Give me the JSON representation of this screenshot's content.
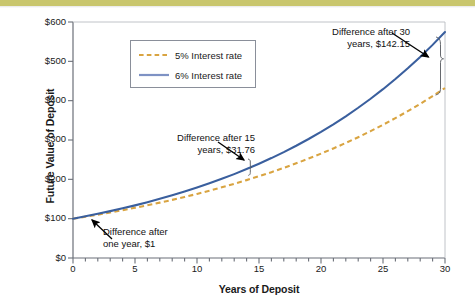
{
  "figure": {
    "background_color": "#ffffff",
    "top_band_color": "#c9c66d"
  },
  "chart_data": {
    "type": "line",
    "title": "",
    "xlabel": "Years of Deposit",
    "ylabel": "Future Value of Deposit",
    "xlim": [
      0,
      30
    ],
    "ylim": [
      0,
      600
    ],
    "grid": false,
    "legend_position": "upper-left-inside",
    "x_ticks": [
      0,
      5,
      10,
      15,
      20,
      25,
      30
    ],
    "x_tick_labels": [
      "0",
      "5",
      "10",
      "15",
      "20",
      "25",
      "30"
    ],
    "x_minor_tick_interval": 1,
    "y_ticks": [
      0,
      100,
      200,
      300,
      400,
      500,
      600
    ],
    "y_tick_labels": [
      "$0",
      "$100",
      "$200",
      "$300",
      "$400",
      "$500",
      "$600"
    ],
    "x": [
      0,
      1,
      2,
      3,
      4,
      5,
      6,
      7,
      8,
      9,
      10,
      11,
      12,
      13,
      14,
      15,
      16,
      17,
      18,
      19,
      20,
      21,
      22,
      23,
      24,
      25,
      26,
      27,
      28,
      29,
      30
    ],
    "series": [
      {
        "name": "5% Interest rate",
        "color": "#d9a441",
        "style": "dashed",
        "values": [
          100.0,
          105.0,
          110.25,
          115.76,
          121.55,
          127.63,
          134.01,
          140.71,
          147.75,
          155.13,
          162.89,
          171.03,
          179.59,
          188.56,
          197.99,
          207.89,
          218.29,
          229.2,
          240.66,
          252.7,
          265.33,
          278.6,
          292.53,
          307.15,
          322.51,
          338.64,
          355.57,
          373.35,
          392.01,
          411.61,
          432.19
        ]
      },
      {
        "name": "6% Interest rate",
        "color": "#3a5f9e",
        "style": "solid",
        "values": [
          100.0,
          106.0,
          112.36,
          119.1,
          126.25,
          133.82,
          141.85,
          150.36,
          159.38,
          168.95,
          179.08,
          189.83,
          201.22,
          213.29,
          226.09,
          239.66,
          254.04,
          269.28,
          285.43,
          302.56,
          320.71,
          339.96,
          360.35,
          381.97,
          404.89,
          429.19,
          454.94,
          482.23,
          511.17,
          541.84,
          574.35
        ]
      }
    ],
    "annotations": [
      {
        "id": "annotation-30",
        "text": "Difference after 30\nyears, $142.15",
        "at_year": 30,
        "value": 142.15
      },
      {
        "id": "annotation-15",
        "text": "Difference after 15\nyears, $31.76",
        "at_year": 15,
        "value": 31.76
      },
      {
        "id": "annotation-1",
        "text": "Difference after\none year, $1",
        "at_year": 1,
        "value": 1
      }
    ]
  },
  "legend": {
    "entries": [
      {
        "label": "5% Interest rate",
        "color": "#d9a441",
        "style": "dashed"
      },
      {
        "label": "6% Interest rate",
        "color": "#3a5f9e",
        "style": "solid"
      }
    ]
  },
  "axis_titles": {
    "x": "Years of Deposit",
    "y": "Future Value of Deposit"
  }
}
